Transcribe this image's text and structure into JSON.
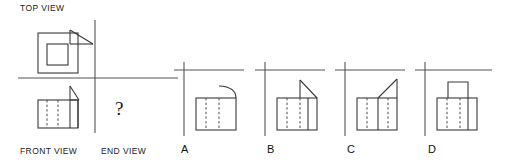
{
  "figure": {
    "kind": "orthographic-projection-puzzle",
    "title_label": "TOP VIEW",
    "front_view_label": "FRONT VIEW",
    "end_view_label": "END VIEW",
    "missing_view_marker": "?",
    "stroke_color": "#3a3a3a",
    "axis_color": "#555555",
    "hidden_line_color": "#4a4a4a",
    "background_color": "#ffffff"
  },
  "given_views": {
    "top_view": {
      "name": "TOP VIEW",
      "description": "Square outline with concentric inner square, plus right triangle projecting from upper right of the top edge",
      "outer_square": {
        "x": 38,
        "y": 33,
        "w": 40,
        "h": 40
      },
      "inner_square": {
        "x": 47,
        "y": 44,
        "w": 21,
        "h": 21
      },
      "triangle_points": "70,30 70,44 93,44",
      "triangle_orientation": "right-angle at lower-left, hypotenuse upper-left to lower-right"
    },
    "front_view": {
      "name": "FRONT VIEW",
      "description": "Rectangle with two vertical hidden (dashed) lines and one solid vertical division; right triangle resting on the upper right",
      "rectangle": {
        "x": 38,
        "y": 100,
        "w": 40,
        "h": 28
      },
      "solid_division_x": 70,
      "hidden_line_xs": [
        47,
        58
      ],
      "triangle_points": "70,86 70,100 79,100"
    },
    "end_view": {
      "name": "END VIEW",
      "description": "Unknown view to be selected from the four options",
      "value": "?"
    }
  },
  "projection_axes": {
    "main": {
      "vertical_x": 95,
      "horizontal_y": 78,
      "v_top": 20,
      "v_bottom": 133,
      "h_left": 18,
      "h_right": 178
    },
    "options": [
      {
        "vertical_x": 184,
        "horizontal_y": 70,
        "v_top": 62,
        "v_bottom": 136,
        "h_left": 174,
        "h_right": 244
      },
      {
        "vertical_x": 265,
        "horizontal_y": 70,
        "v_top": 62,
        "v_bottom": 136,
        "h_left": 255,
        "h_right": 325
      },
      {
        "vertical_x": 345,
        "horizontal_y": 70,
        "v_top": 62,
        "v_bottom": 136,
        "h_left": 335,
        "h_right": 405
      },
      {
        "vertical_x": 425,
        "horizontal_y": 70,
        "v_top": 62,
        "v_bottom": 136,
        "h_left": 415,
        "h_right": 492
      }
    ]
  },
  "options": [
    {
      "id": "A",
      "label": "A",
      "description": "Rectangle with two vertical hidden lines; quarter-round curved profile at the upper right corner",
      "rectangle": {
        "x": 196,
        "y": 98,
        "w": 40,
        "h": 32
      },
      "hidden_line_xs": [
        206,
        219
      ],
      "feature": "curve",
      "curve_path": "M 219 88 C 229 88 236 92 236 98",
      "curve_note": "convex arc rising from interior to top right corner"
    },
    {
      "id": "B",
      "label": "B",
      "description": "Rectangle with two vertical hidden lines and a solid vertical division at the right; right triangle on the upper right, hypotenuse descending to the right",
      "rectangle": {
        "x": 277,
        "y": 98,
        "w": 40,
        "h": 32
      },
      "hidden_line_xs": [
        287,
        300
      ],
      "solid_division_x": 308,
      "feature": "triangle",
      "triangle_points": "300,80 300,98 317,98"
    },
    {
      "id": "C",
      "label": "C",
      "description": "Rectangle with two vertical hidden lines and a solid vertical division; straight diagonal rising from the interior top to the upper right corner",
      "rectangle": {
        "x": 357,
        "y": 98,
        "w": 40,
        "h": 32
      },
      "hidden_line_xs": [
        367,
        388
      ],
      "solid_division_x": 378,
      "feature": "diagonal",
      "diagonal_points": "378,98 397,79",
      "diagonal_note": "slope up to the right above the rectangle"
    },
    {
      "id": "D",
      "label": "D",
      "description": "Rectangle with two vertical hidden lines and a solid vertical division; small raised rectangular boss centered on the top edge",
      "rectangle": {
        "x": 437,
        "y": 98,
        "w": 40,
        "h": 32
      },
      "hidden_line_xs": [
        447,
        460
      ],
      "solid_division_x": 468,
      "feature": "boss",
      "boss_rect": {
        "x": 448,
        "y": 82,
        "w": 20,
        "h": 16
      }
    }
  ]
}
